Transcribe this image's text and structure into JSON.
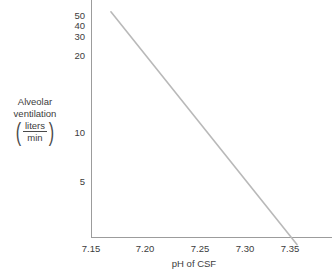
{
  "figure": {
    "background_color": "#ffffff",
    "axis_color": "#9c9c9c",
    "text_color": "#3c3c3c",
    "line_color": "#b9b9b9",
    "top_caption": ""
  },
  "ylabel": {
    "line1": "Alveolar",
    "line2": "ventilation",
    "numerator": "liters",
    "denominator": "min",
    "paren_open": "(",
    "paren_close": ")"
  },
  "xlabel": {
    "text": "pH of CSF"
  },
  "chart_data": {
    "type": "line",
    "title": "",
    "subtitle": "",
    "xlabel": "pH of CSF",
    "ylabel": "Alveolar ventilation (liters/min)",
    "xscale": "linear",
    "yscale": "log",
    "xlim": [
      7.135,
      7.38
    ],
    "ylim": [
      1.9,
      58
    ],
    "grid": false,
    "legend": null,
    "xticks": [
      {
        "value": 7.15,
        "label": "7.15",
        "px": 91
      },
      {
        "value": 7.2,
        "label": "7.20",
        "px": 145
      },
      {
        "value": 7.25,
        "label": "7.25",
        "px": 200
      },
      {
        "value": 7.3,
        "label": "7.30",
        "px": 245
      },
      {
        "value": 7.35,
        "label": "7.35",
        "px": 290
      }
    ],
    "yticks": [
      {
        "value": 50,
        "label": "50",
        "px": 16
      },
      {
        "value": 40,
        "label": "40",
        "px": 26
      },
      {
        "value": 30,
        "label": "30",
        "px": 37
      },
      {
        "value": 20,
        "label": "20",
        "px": 56
      },
      {
        "value": 10,
        "label": "10",
        "px": 133
      },
      {
        "value": 5,
        "label": "5",
        "px": 182
      }
    ],
    "series": [
      {
        "name": "Alveolar ventilation response to CSF pH",
        "color": "#b9b9b9",
        "width": 1.6,
        "points": [
          {
            "x": 7.17,
            "y": 53.0
          },
          {
            "x": 7.357,
            "y": 2.1
          }
        ]
      }
    ],
    "annotations": []
  }
}
